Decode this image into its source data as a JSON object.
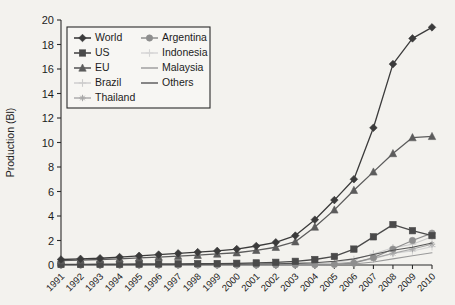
{
  "chart_data": {
    "type": "line",
    "title": "",
    "xlabel": "",
    "ylabel": "Production (Bl)",
    "xlim": [
      1991,
      2010
    ],
    "ylim": [
      0,
      20
    ],
    "ytick_values": [
      0,
      2,
      4,
      6,
      8,
      10,
      12,
      14,
      16,
      18,
      20
    ],
    "ytick_labels": [
      "0",
      "2",
      "4",
      "6",
      "8",
      "10",
      "12",
      "14",
      "16",
      "18",
      "20"
    ],
    "grid": false,
    "legend_position": "upper-left",
    "categories": [
      "1991",
      "1992",
      "1993",
      "1994",
      "1995",
      "1996",
      "1997",
      "1998",
      "1999",
      "2000",
      "2001",
      "2002",
      "2003",
      "2004",
      "2005",
      "2006",
      "2007",
      "2008",
      "2009",
      "2010"
    ],
    "series": [
      {
        "name": "World",
        "marker": "diamond",
        "color": "#3b3b3b",
        "line_width": 1.3,
        "values": [
          0.45,
          0.5,
          0.55,
          0.65,
          0.75,
          0.85,
          0.95,
          1.05,
          1.15,
          1.3,
          1.55,
          1.85,
          2.4,
          3.7,
          5.3,
          7.0,
          11.2,
          16.4,
          18.5,
          19.4
        ]
      },
      {
        "name": "US",
        "marker": "square",
        "color": "#4a4a4a",
        "line_width": 1.3,
        "values": [
          0.05,
          0.05,
          0.06,
          0.07,
          0.08,
          0.09,
          0.1,
          0.11,
          0.12,
          0.14,
          0.17,
          0.22,
          0.3,
          0.45,
          0.7,
          1.3,
          2.3,
          3.3,
          2.8,
          2.4
        ]
      },
      {
        "name": "EU",
        "marker": "triangle",
        "color": "#5c5c5c",
        "line_width": 1.3,
        "values": [
          0.35,
          0.4,
          0.45,
          0.5,
          0.58,
          0.65,
          0.72,
          0.8,
          0.9,
          1.0,
          1.2,
          1.45,
          1.9,
          3.1,
          4.5,
          6.1,
          7.6,
          9.1,
          10.4,
          10.5
        ]
      },
      {
        "name": "Brazil",
        "marker": "plus",
        "color": "#cccccc",
        "line_width": 1.1,
        "values": [
          0.02,
          0.02,
          0.02,
          0.02,
          0.03,
          0.03,
          0.03,
          0.04,
          0.04,
          0.05,
          0.06,
          0.07,
          0.09,
          0.12,
          0.2,
          0.45,
          0.9,
          1.4,
          1.7,
          2.3
        ]
      },
      {
        "name": "Thailand",
        "marker": "star",
        "color": "#a8a8a8",
        "line_width": 1.1,
        "values": [
          0.01,
          0.01,
          0.01,
          0.01,
          0.01,
          0.02,
          0.02,
          0.02,
          0.02,
          0.03,
          0.03,
          0.04,
          0.05,
          0.07,
          0.1,
          0.25,
          0.55,
          0.95,
          1.3,
          1.7
        ]
      },
      {
        "name": "Argentina",
        "marker": "circle",
        "color": "#8e8e8e",
        "line_width": 1.2,
        "values": [
          0.0,
          0.0,
          0.0,
          0.0,
          0.0,
          0.0,
          0.0,
          0.0,
          0.0,
          0.0,
          0.0,
          0.01,
          0.02,
          0.03,
          0.05,
          0.15,
          0.6,
          1.3,
          2.0,
          2.6
        ]
      },
      {
        "name": "Indonesia",
        "marker": "plus",
        "color": "#d5d5d5",
        "line_width": 1.1,
        "values": [
          0.0,
          0.0,
          0.0,
          0.0,
          0.0,
          0.0,
          0.0,
          0.0,
          0.0,
          0.01,
          0.01,
          0.01,
          0.02,
          0.03,
          0.05,
          0.2,
          0.5,
          0.95,
          1.15,
          1.5
        ]
      },
      {
        "name": "Malaysia",
        "marker": "none",
        "color": "#9a9a9a",
        "line_width": 1.1,
        "values": [
          0.0,
          0.0,
          0.0,
          0.0,
          0.0,
          0.0,
          0.0,
          0.0,
          0.0,
          0.0,
          0.0,
          0.0,
          0.01,
          0.01,
          0.02,
          0.08,
          0.25,
          0.5,
          0.75,
          1.0
        ]
      },
      {
        "name": "Others",
        "marker": "none",
        "color": "#555555",
        "line_width": 1.1,
        "values": [
          0.02,
          0.02,
          0.02,
          0.03,
          0.03,
          0.04,
          0.04,
          0.05,
          0.06,
          0.07,
          0.08,
          0.1,
          0.13,
          0.18,
          0.3,
          0.5,
          0.85,
          1.2,
          1.45,
          1.8
        ]
      }
    ]
  },
  "legend": {
    "entries": [
      {
        "label": "World"
      },
      {
        "label": "US"
      },
      {
        "label": "EU"
      },
      {
        "label": "Brazil"
      },
      {
        "label": "Thailand"
      },
      {
        "label": "Argentina"
      },
      {
        "label": "Indonesia"
      },
      {
        "label": "Malaysia"
      },
      {
        "label": "Others"
      }
    ]
  },
  "colors": {
    "background": "#f3f2ee",
    "axis": "#2b2b2b",
    "text": "#1c1c1c"
  }
}
